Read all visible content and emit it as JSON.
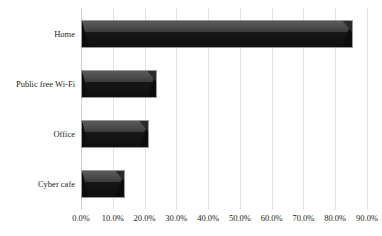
{
  "chart_data": {
    "type": "bar",
    "orientation": "horizontal",
    "title": "",
    "subtitle": "",
    "xlabel": "",
    "ylabel": "",
    "categories": [
      "Home",
      "Public free Wi-Fi",
      "Office",
      "Cyber cafe"
    ],
    "values": [
      85.5,
      24.0,
      21.5,
      14.0
    ],
    "series": [
      {
        "name": "",
        "values": [
          85.5,
          24.0,
          21.5,
          14.0
        ]
      }
    ],
    "xlim": [
      0,
      90
    ],
    "ylim": null,
    "x_tick_labels": [
      "0.0%",
      "10.0%",
      "20.0%",
      "30.0%",
      "40.0%",
      "50.0%",
      "60.0%",
      "70.0%",
      "80.0%",
      "90.0%"
    ],
    "x_tick_values": [
      0,
      10,
      20,
      30,
      40,
      50,
      60,
      70,
      80,
      90
    ],
    "grid": "vertical",
    "legend": "none",
    "annotations": [],
    "colors": {
      "bar_top_face": "#4a4a4a",
      "bar_body": "#141414",
      "bar_outline": "#9b9b9b",
      "gridline": "#e3e3e3",
      "axis": "#d2d2d2",
      "text": "#231f20",
      "background": "#ffffff"
    }
  }
}
